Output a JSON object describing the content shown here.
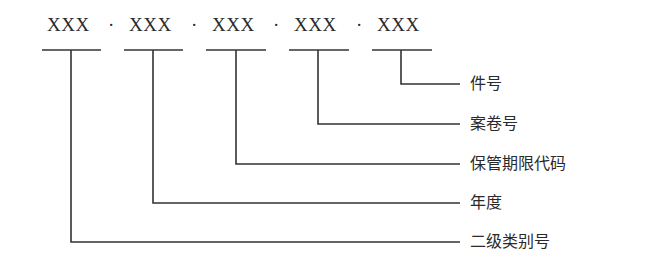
{
  "code": {
    "segments": [
      "XXX",
      "XXX",
      "XXX",
      "XXX",
      "XXX"
    ],
    "separator": "·"
  },
  "labels": [
    {
      "text": "件号",
      "segment_index": 4
    },
    {
      "text": "案卷号",
      "segment_index": 3
    },
    {
      "text": "保管期限代码",
      "segment_index": 2
    },
    {
      "text": "年度",
      "segment_index": 1
    },
    {
      "text": "二级类别号",
      "segment_index": 0
    }
  ],
  "colors": {
    "line": "#333333",
    "text": "#2a2a2a"
  }
}
